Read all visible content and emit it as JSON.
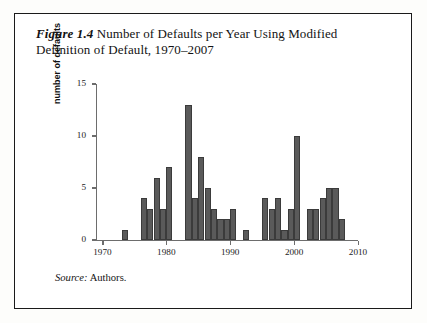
{
  "figure": {
    "label": "Figure 1.4",
    "title_rest": " Number of Defaults per Year Using Modified Definition of Default, 1970–2007",
    "source_label": "Source:",
    "source_value": " Authors."
  },
  "colors": {
    "bar_fill": "#5a5a5a",
    "bar_stroke": "#3b3b3b",
    "axis": "#6d6d6d",
    "frame": "#1a1a1a",
    "text": "#121212",
    "page_bg": "#ffffff"
  },
  "chart_data": {
    "type": "bar",
    "title": "Figure 1.4 Number of Defaults per Year Using Modified Definition of Default, 1970–2007",
    "xlabel": "",
    "ylabel": "number of defaults",
    "xlim": [
      1969,
      2010
    ],
    "ylim": [
      0,
      15
    ],
    "grid": false,
    "legend": null,
    "y_ticks": [
      0,
      5,
      10,
      15
    ],
    "y_tick_labels": [
      "0",
      "5",
      "10",
      "15"
    ],
    "x_ticks": [
      1970,
      1980,
      1990,
      2000,
      2010
    ],
    "x_tick_labels": [
      "1970",
      "1980",
      "1990",
      "2000",
      "2010"
    ],
    "categories": [
      1970,
      1971,
      1972,
      1973,
      1974,
      1975,
      1976,
      1977,
      1978,
      1979,
      1980,
      1981,
      1982,
      1983,
      1984,
      1985,
      1986,
      1987,
      1988,
      1989,
      1990,
      1991,
      1992,
      1993,
      1994,
      1995,
      1996,
      1997,
      1998,
      1999,
      2000,
      2001,
      2002,
      2003,
      2004,
      2005,
      2006,
      2007
    ],
    "values": [
      0,
      0,
      0,
      1,
      0,
      0,
      4,
      3,
      6,
      3,
      7,
      0,
      0,
      13,
      4,
      8,
      5,
      3,
      2,
      2,
      3,
      0,
      1,
      0,
      0,
      4,
      3,
      4,
      1,
      3,
      10,
      0,
      3,
      3,
      4,
      5,
      5,
      2
    ]
  }
}
